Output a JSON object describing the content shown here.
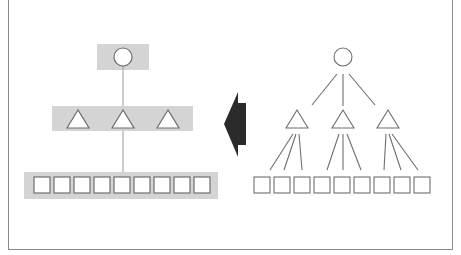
{
  "diagram": {
    "colors": {
      "band": "#d4d4d4",
      "stroke": "#6e6e6e",
      "arrow": "#2b2b2b",
      "frame": "#8a8a8a"
    },
    "left_layered": {
      "levels": [
        {
          "name": "root",
          "shape": "circle",
          "count": 1
        },
        {
          "name": "middle",
          "shape": "triangle",
          "count": 3
        },
        {
          "name": "leaves",
          "shape": "square",
          "count": 9
        }
      ]
    },
    "arrow": {
      "direction": "left"
    },
    "right_tree": {
      "root": {
        "shape": "circle"
      },
      "children": [
        {
          "shape": "triangle",
          "leaf_count": 3
        },
        {
          "shape": "triangle",
          "leaf_count": 3
        },
        {
          "shape": "triangle",
          "leaf_count": 3
        }
      ]
    }
  }
}
